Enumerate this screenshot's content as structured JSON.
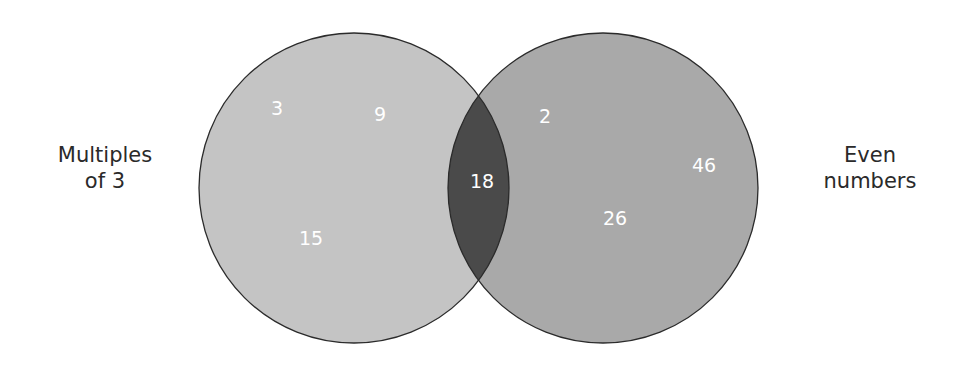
{
  "diagram": {
    "type": "venn",
    "sets": [
      {
        "label_line1": "Multiples",
        "label_line2": "of 3",
        "fill": "#c4c4c4",
        "only_elements": [
          "3",
          "9",
          "15"
        ]
      },
      {
        "label_line1": "Even",
        "label_line2": "numbers",
        "fill": "#a9a9a9",
        "only_elements": [
          "2",
          "46",
          "26"
        ]
      }
    ],
    "intersection": {
      "fill": "#4a4a4a",
      "elements": [
        "18"
      ]
    },
    "stroke_color": "#2b2b2b"
  }
}
